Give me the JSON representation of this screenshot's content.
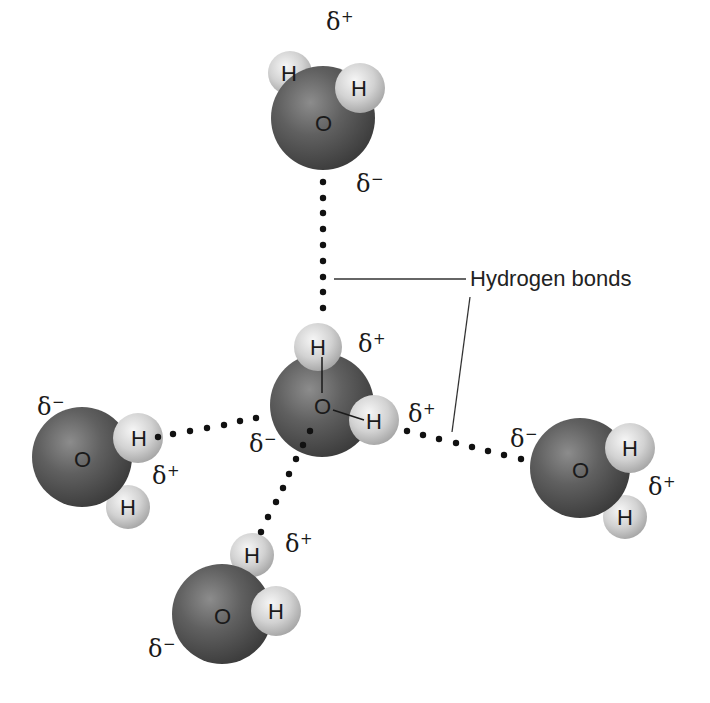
{
  "colors": {
    "oxygen_light": "#8a8a8a",
    "oxygen_mid": "#5e5e5e",
    "oxygen_dark": "#3e3e3e",
    "hydrogen_light": "#f2f2f2",
    "hydrogen_mid": "#cfcfcf",
    "hydrogen_dark": "#a8a8a8",
    "bond_dots": "#111111",
    "callout_line": "#333333",
    "text": "#1a1a1a"
  },
  "labels": {
    "oxygen": "O",
    "hydrogen": "H",
    "delta": "δ",
    "plus": "+",
    "minus": "−",
    "callout": "Hydrogen bonds"
  },
  "molecules": [
    {
      "name": "top",
      "oxygen": [
        323,
        118
      ],
      "r": 52,
      "hydrogens": [
        [
          290,
          73
        ],
        [
          360,
          88
        ]
      ],
      "delta_plus": [
        352,
        28
      ],
      "delta_minus": [
        355,
        188
      ]
    },
    {
      "name": "center",
      "oxygen": [
        322,
        405
      ],
      "r": 52,
      "hydrogens": [
        [
          318,
          347
        ],
        [
          374,
          420
        ]
      ],
      "delta_plus_top": [
        358,
        350
      ],
      "delta_plus_right": [
        408,
        420
      ],
      "delta_minus": [
        248,
        450
      ]
    },
    {
      "name": "left",
      "oxygen": [
        82,
        457
      ],
      "r": 50,
      "hydrogens": [
        [
          138,
          438
        ],
        [
          128,
          507
        ]
      ],
      "delta_plus": [
        152,
        482
      ],
      "delta_minus": [
        36,
        413
      ]
    },
    {
      "name": "bottom",
      "oxygen": [
        222,
        614
      ],
      "r": 50,
      "hydrogens": [
        [
          252,
          555
        ],
        [
          276,
          611
        ]
      ],
      "delta_plus": [
        285,
        550
      ],
      "delta_minus": [
        148,
        655
      ]
    },
    {
      "name": "right",
      "oxygen": [
        580,
        468
      ],
      "r": 50,
      "hydrogens": [
        [
          630,
          448
        ],
        [
          625,
          517
        ]
      ],
      "delta_plus": [
        648,
        493
      ],
      "delta_minus": [
        510,
        445
      ]
    }
  ],
  "bonds": [
    {
      "name": "vertical",
      "dots": [
        [
          323,
          182
        ],
        [
          323,
          198
        ],
        [
          323,
          213
        ],
        [
          323,
          229
        ],
        [
          323,
          245
        ],
        [
          323,
          261
        ],
        [
          323,
          277
        ],
        [
          323,
          292
        ],
        [
          323,
          308
        ]
      ]
    },
    {
      "name": "left",
      "dots": [
        [
          158,
          437
        ],
        [
          173,
          434
        ],
        [
          190,
          431
        ],
        [
          207,
          428
        ],
        [
          224,
          425
        ],
        [
          240,
          421
        ],
        [
          256,
          418
        ]
      ]
    },
    {
      "name": "bottom-left",
      "dots": [
        [
          310,
          431
        ],
        [
          303,
          445
        ],
        [
          296,
          459
        ],
        [
          289,
          474
        ],
        [
          283,
          488
        ],
        [
          276,
          502
        ],
        [
          268,
          517
        ],
        [
          261,
          532
        ]
      ]
    },
    {
      "name": "right",
      "dots": [
        [
          407,
          431
        ],
        [
          423,
          435
        ],
        [
          439,
          439
        ],
        [
          456,
          443
        ],
        [
          472,
          447
        ],
        [
          488,
          451
        ],
        [
          504,
          455
        ],
        [
          521,
          459
        ]
      ]
    }
  ],
  "callout": {
    "text_pos": [
      470,
      286
    ],
    "line1": [
      [
        334,
        279
      ],
      [
        466,
        279
      ]
    ],
    "line2": [
      [
        470,
        297
      ],
      [
        452,
        432
      ]
    ]
  }
}
